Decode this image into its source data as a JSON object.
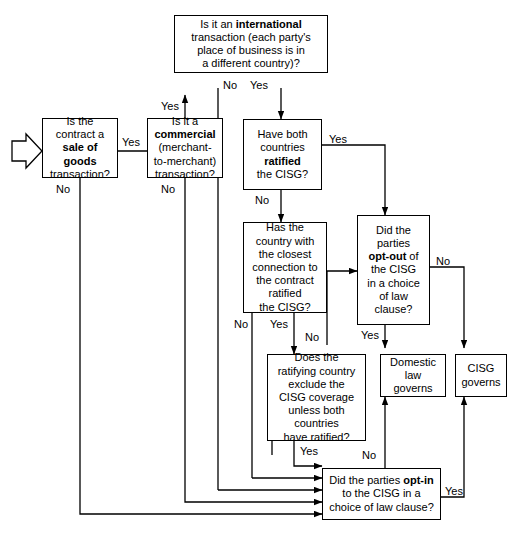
{
  "diagram": {
    "stroke_color": "#000000",
    "background_color": "#ffffff"
  },
  "nodes": {
    "start_arrow": "start-entry-arrow",
    "sale_of_goods": "Is the contract a sale of goods transaction?",
    "commercial": "Is it a commercial (merchant-to-merchant) transaction?",
    "international": "Is it an international transaction (each party's place of business is in a different country)?",
    "both_ratified": "Have both countries ratified the CISG?",
    "closest_connection": "Has the country with the closest connection to the contract ratified the CISG?",
    "opt_out": "Did the parties opt-out of the CISG in a choice of law clause?",
    "exclude_coverage": "Does the ratifying country exclude the CISG coverage unless both countries have ratified?",
    "domestic_law": "Domestic law governs",
    "cisg_governs": "CISG governs",
    "opt_in": "Did the parties opt-in to the CISG in a choice of law clause?"
  },
  "node_lines": {
    "sale_of_goods": [
      "Is the",
      "contract a",
      "sale of",
      "goods",
      "transaction?"
    ],
    "commercial": [
      "Is it a",
      "commercial",
      "(merchant-",
      "to-merchant)",
      "transaction?"
    ],
    "international": [
      "Is it an international",
      "transaction (each party's",
      "place of business is in",
      "a different country)?"
    ],
    "both_ratified": [
      "Have both",
      "countries",
      "ratified",
      "the CISG?"
    ],
    "closest_connection": [
      "Has the",
      "country with",
      "the closest",
      "connection to",
      "the contract",
      "ratified",
      "the CISG?"
    ],
    "opt_out": [
      "Did the",
      "parties",
      "opt-out of",
      "the CISG",
      "in a choice",
      "of law",
      "clause?"
    ],
    "exclude_coverage": [
      "Does the",
      "ratifying country",
      "exclude the",
      "CISG coverage",
      "unless both",
      "countries",
      "have ratified?"
    ],
    "domestic_law": [
      "Domestic",
      "law",
      "governs"
    ],
    "cisg_governs": [
      "CISG",
      "governs"
    ],
    "opt_in": [
      "Did the parties opt-in",
      "to the CISG in a",
      "choice of law clause?"
    ]
  },
  "edge_labels": {
    "sale_yes": "Yes",
    "sale_no": "No",
    "commercial_yes": "Yes",
    "commercial_no": "No",
    "international_no": "No",
    "international_yes": "Yes",
    "both_ratified_yes": "Yes",
    "both_ratified_no": "No",
    "closest_no": "No",
    "closest_yes": "Yes",
    "opt_out_no": "No",
    "opt_out_yes": "Yes",
    "exclude_no": "No",
    "exclude_yes": "Yes",
    "opt_in_no": "No",
    "opt_in_yes": "Yes"
  }
}
